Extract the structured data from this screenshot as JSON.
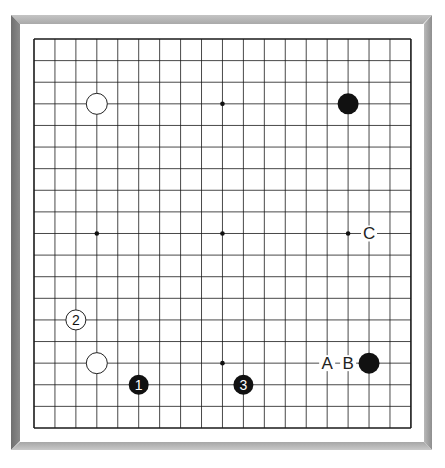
{
  "board": {
    "size": 19,
    "origin": {
      "x": 34,
      "y": 39
    },
    "spacing": {
      "x": 20.94,
      "y": 21.61
    },
    "line_color": "#1a1a1a",
    "star_points": [
      [
        3,
        3
      ],
      [
        9,
        3
      ],
      [
        15,
        3
      ],
      [
        3,
        9
      ],
      [
        9,
        9
      ],
      [
        15,
        9
      ],
      [
        3,
        15
      ],
      [
        9,
        15
      ],
      [
        15,
        15
      ]
    ],
    "hidden_star_points": [
      [
        3,
        3
      ],
      [
        15,
        3
      ],
      [
        15,
        9
      ],
      [
        3,
        15
      ],
      [
        15,
        15
      ]
    ]
  },
  "stones": [
    {
      "col": 3,
      "row": 3,
      "color": "white",
      "label": ""
    },
    {
      "col": 15,
      "row": 3,
      "color": "black",
      "label": ""
    },
    {
      "col": 3,
      "row": 15,
      "color": "white",
      "label": ""
    },
    {
      "col": 16,
      "row": 15,
      "color": "black",
      "label": ""
    },
    {
      "col": 5,
      "row": 16,
      "color": "black",
      "label": "1"
    },
    {
      "col": 2,
      "row": 13,
      "color": "white",
      "label": "2"
    },
    {
      "col": 10,
      "row": 16,
      "color": "black",
      "label": "3"
    }
  ],
  "markers": [
    {
      "col": 14,
      "row": 15,
      "label": "A"
    },
    {
      "col": 15,
      "row": 15,
      "label": "B"
    },
    {
      "col": 16,
      "row": 9,
      "label": "C"
    }
  ],
  "colors": {
    "black_stone": "#111111",
    "white_stone": "#ffffff",
    "stone_outline": "#222222"
  }
}
